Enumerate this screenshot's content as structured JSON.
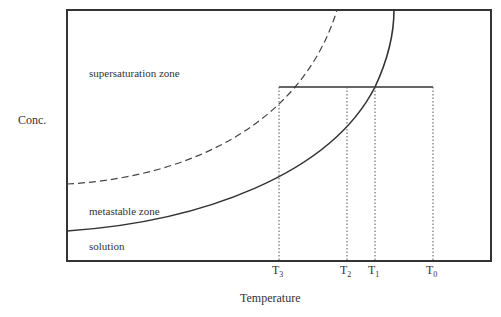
{
  "diagram": {
    "y_axis_label": "Conc.",
    "x_axis_label": "Temperature",
    "zones": {
      "supersaturation": "supersaturation zone",
      "metastable": "metastable zone",
      "solution": "solution"
    },
    "ticks": [
      {
        "base": "T",
        "sub": "3"
      },
      {
        "base": "T",
        "sub": "2"
      },
      {
        "base": "T",
        "sub": "1"
      },
      {
        "base": "T",
        "sub": "0"
      }
    ],
    "curves": [
      {
        "name": "solubility curve",
        "style": "solid"
      },
      {
        "name": "supersolubility curve",
        "style": "dashed"
      }
    ],
    "colors": {
      "line": "#333333",
      "background": "#ffffff"
    }
  }
}
